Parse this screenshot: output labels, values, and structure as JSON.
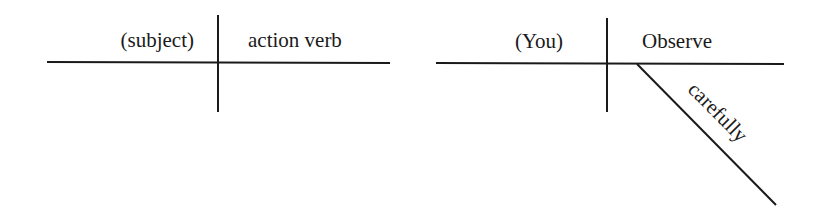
{
  "diagrams": [
    {
      "name": "template",
      "subject": "(subject)",
      "verb": "action verb"
    },
    {
      "name": "example",
      "subject": "(You)",
      "verb": "Observe",
      "modifier": "carefully"
    }
  ],
  "colors": {
    "line": "#1a1a1a",
    "background": "#ffffff"
  }
}
